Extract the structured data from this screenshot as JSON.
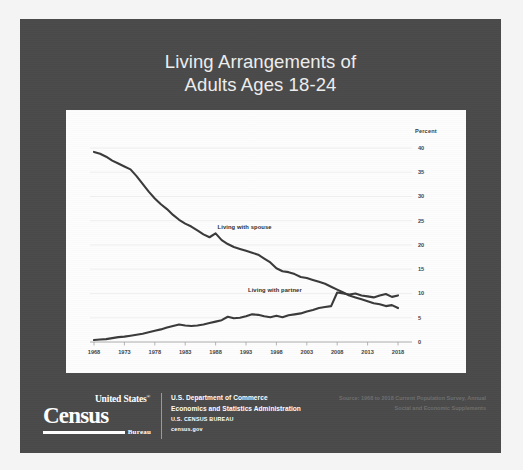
{
  "slide": {
    "title_line1": "Living Arrangements of",
    "title_line2": "Adults Ages 18-24",
    "background_color": "#4a4a4a",
    "panel_color": "#fdfdfd"
  },
  "footer": {
    "logo": {
      "united_states": "United States",
      "registered_mark": "®",
      "census": "Census",
      "bureau": "Bureau"
    },
    "agency_line1": "U.S. Department of Commerce",
    "agency_line2": "Economics and Statistics Administration",
    "agency_line3": "U.S. CENSUS BUREAU",
    "agency_line4": "census.gov",
    "source_line1": "Source: 1968 to 2018 Current Population Survey, Annual",
    "source_line2": "Social and Economic Supplements"
  },
  "chart_data": {
    "type": "line",
    "title": "Living Arrangements of Adults Ages 18-24",
    "xlabel": "",
    "ylabel": "Percent",
    "ylabel_position": "top-right",
    "xlim": [
      1968,
      2018
    ],
    "ylim": [
      0,
      40
    ],
    "yticks": [
      0,
      5,
      10,
      15,
      20,
      25,
      30,
      35,
      40
    ],
    "xticks": [
      1968,
      1973,
      1978,
      1983,
      1988,
      1993,
      1998,
      2003,
      2008,
      2013,
      2018
    ],
    "grid": true,
    "grid_color": "#e8e8e8",
    "line_color": "#3a3a3a",
    "legend_position": "inline-annotations",
    "x": [
      1968,
      1969,
      1970,
      1971,
      1972,
      1973,
      1974,
      1975,
      1976,
      1977,
      1978,
      1979,
      1980,
      1981,
      1982,
      1983,
      1984,
      1985,
      1986,
      1987,
      1988,
      1989,
      1990,
      1991,
      1992,
      1993,
      1994,
      1995,
      1996,
      1997,
      1998,
      1999,
      2000,
      2001,
      2002,
      2003,
      2004,
      2005,
      2006,
      2007,
      2008,
      2009,
      2010,
      2011,
      2012,
      2013,
      2014,
      2015,
      2016,
      2017,
      2018
    ],
    "series": [
      {
        "name": "Living with spouse",
        "values": [
          39.2,
          38.8,
          38.2,
          37.4,
          36.8,
          36.2,
          35.6,
          34.2,
          32.6,
          31.0,
          29.6,
          28.4,
          27.4,
          26.2,
          25.2,
          24.4,
          23.8,
          23.0,
          22.2,
          21.6,
          22.4,
          21.0,
          20.2,
          19.6,
          19.2,
          18.8,
          18.4,
          18.0,
          17.2,
          16.4,
          15.2,
          14.6,
          14.4,
          14.0,
          13.4,
          13.2,
          12.8,
          12.4,
          12.0,
          11.4,
          10.8,
          10.2,
          9.6,
          9.2,
          8.8,
          8.4,
          8.0,
          7.8,
          7.4,
          7.6,
          7.0
        ]
      },
      {
        "name": "Living with partner",
        "values": [
          0.4,
          0.5,
          0.6,
          0.8,
          1.0,
          1.1,
          1.3,
          1.5,
          1.7,
          2.0,
          2.3,
          2.6,
          3.0,
          3.3,
          3.6,
          3.4,
          3.3,
          3.4,
          3.6,
          3.9,
          4.2,
          4.5,
          5.2,
          4.9,
          5.0,
          5.3,
          5.7,
          5.6,
          5.3,
          5.1,
          5.4,
          5.1,
          5.5,
          5.7,
          5.9,
          6.3,
          6.6,
          7.0,
          7.2,
          7.4,
          10.2,
          10.0,
          9.8,
          10.0,
          9.6,
          9.4,
          9.2,
          9.6,
          9.9,
          9.3,
          9.6
        ]
      }
    ],
    "annotations": [
      {
        "text": "Living with spouse",
        "x": 1988,
        "y": 23.5
      },
      {
        "text": "Living with partner",
        "x": 1993,
        "y": 10.5
      }
    ]
  }
}
